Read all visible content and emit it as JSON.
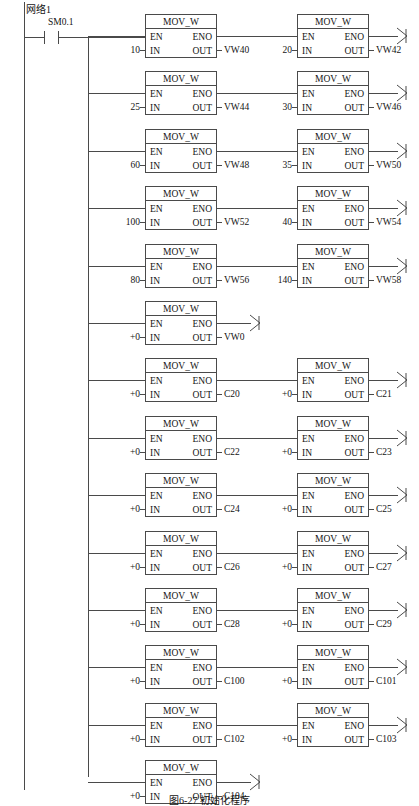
{
  "diagram": {
    "type": "ladder-logic",
    "network_label": "网络1",
    "contact": {
      "label": "SM0.1",
      "type": "normally-open"
    },
    "block_title": "MOV_W",
    "pins": {
      "en": "EN",
      "eno": "ENO",
      "in": "IN",
      "out": "OUT"
    },
    "colors": {
      "line": "#4a4a4a",
      "text": "#141414",
      "background": "#ffffff"
    },
    "caption": "图6-27 初始化程序"
  },
  "rungs": [
    {
      "index": 1,
      "blocks": [
        {
          "column": "left",
          "title": "MOV_W",
          "in": "10",
          "out": "VW40"
        },
        {
          "column": "right",
          "title": "MOV_W",
          "in": "20",
          "out": "VW42"
        }
      ]
    },
    {
      "index": 2,
      "blocks": [
        {
          "column": "left",
          "title": "MOV_W",
          "in": "25",
          "out": "VW44"
        },
        {
          "column": "right",
          "title": "MOV_W",
          "in": "30",
          "out": "VW46"
        }
      ]
    },
    {
      "index": 3,
      "blocks": [
        {
          "column": "left",
          "title": "MOV_W",
          "in": "60",
          "out": "VW48"
        },
        {
          "column": "right",
          "title": "MOV_W",
          "in": "35",
          "out": "VW50"
        }
      ]
    },
    {
      "index": 4,
      "blocks": [
        {
          "column": "left",
          "title": "MOV_W",
          "in": "100",
          "out": "VW52"
        },
        {
          "column": "right",
          "title": "MOV_W",
          "in": "40",
          "out": "VW54"
        }
      ]
    },
    {
      "index": 5,
      "blocks": [
        {
          "column": "left",
          "title": "MOV_W",
          "in": "80",
          "out": "VW56"
        },
        {
          "column": "right",
          "title": "MOV_W",
          "in": "140",
          "out": "VW58"
        }
      ]
    },
    {
      "index": 6,
      "blocks": [
        {
          "column": "left",
          "title": "MOV_W",
          "in": "+0",
          "out": "VW0"
        }
      ]
    },
    {
      "index": 7,
      "blocks": [
        {
          "column": "left",
          "title": "MOV_W",
          "in": "+0",
          "out": "C20"
        },
        {
          "column": "right",
          "title": "MOV_W",
          "in": "+0",
          "out": "C21"
        }
      ]
    },
    {
      "index": 8,
      "blocks": [
        {
          "column": "left",
          "title": "MOV_W",
          "in": "+0",
          "out": "C22"
        },
        {
          "column": "right",
          "title": "MOV_W",
          "in": "+0",
          "out": "C23"
        }
      ]
    },
    {
      "index": 9,
      "blocks": [
        {
          "column": "left",
          "title": "MOV_W",
          "in": "+0",
          "out": "C24"
        },
        {
          "column": "right",
          "title": "MOV_W",
          "in": "+0",
          "out": "C25"
        }
      ]
    },
    {
      "index": 10,
      "blocks": [
        {
          "column": "left",
          "title": "MOV_W",
          "in": "+0",
          "out": "C26"
        },
        {
          "column": "right",
          "title": "MOV_W",
          "in": "+0",
          "out": "C27"
        }
      ]
    },
    {
      "index": 11,
      "blocks": [
        {
          "column": "left",
          "title": "MOV_W",
          "in": "+0",
          "out": "C28"
        },
        {
          "column": "right",
          "title": "MOV_W",
          "in": "+0",
          "out": "C29"
        }
      ]
    },
    {
      "index": 12,
      "blocks": [
        {
          "column": "left",
          "title": "MOV_W",
          "in": "+0",
          "out": "C100"
        },
        {
          "column": "right",
          "title": "MOV_W",
          "in": "+0",
          "out": "C101"
        }
      ]
    },
    {
      "index": 13,
      "blocks": [
        {
          "column": "left",
          "title": "MOV_W",
          "in": "+0",
          "out": "C102"
        },
        {
          "column": "right",
          "title": "MOV_W",
          "in": "+0",
          "out": "C103"
        }
      ]
    },
    {
      "index": 14,
      "blocks": [
        {
          "column": "left",
          "title": "MOV_W",
          "in": "+0",
          "out": "C104"
        }
      ]
    }
  ]
}
